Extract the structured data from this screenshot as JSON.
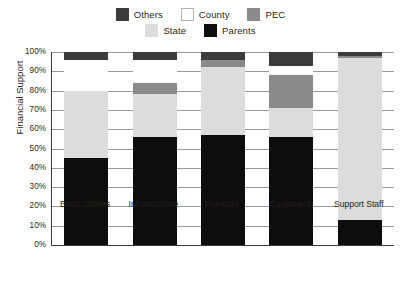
{
  "chart_data": {
    "type": "bar",
    "subtype": "stacked-bar-100-percent",
    "title": "",
    "xlabel": "",
    "ylabel": "Financial Support",
    "ylim": [
      0,
      100
    ],
    "yticks": [
      "0%",
      "10%",
      "20%",
      "30%",
      "40%",
      "50%",
      "60%",
      "70%",
      "80%",
      "90%",
      "100%"
    ],
    "grid": true,
    "legend_position": "top-center",
    "categories": [
      "Basic Utilities",
      "Infrastructure",
      "Furniture",
      "Equipment",
      "Support Staff"
    ],
    "series": [
      {
        "name": "Parents",
        "color": "#0d0d0d",
        "values": [
          45,
          56,
          57,
          56,
          13
        ]
      },
      {
        "name": "State",
        "color": "#dcdcdc",
        "values": [
          35,
          22,
          35,
          15,
          84
        ]
      },
      {
        "name": "PEC",
        "color": "#8a8a8a",
        "values": [
          0,
          6,
          4,
          17,
          1
        ]
      },
      {
        "name": "County",
        "color": "#ffffff",
        "values": [
          16,
          12,
          0,
          5,
          0
        ]
      },
      {
        "name": "Others",
        "color": "#3b3b3b",
        "values": [
          4,
          4,
          4,
          7,
          2
        ]
      }
    ]
  },
  "legend": {
    "rows": [
      [
        {
          "label": "Others",
          "color": "#3b3b3b",
          "border": "none"
        },
        {
          "label": "County",
          "color": "#ffffff",
          "border": "1px solid #b4b4b4"
        },
        {
          "label": "PEC",
          "color": "#8a8a8a",
          "border": "none"
        }
      ],
      [
        {
          "label": "State",
          "color": "#dcdcdc",
          "border": "none"
        },
        {
          "label": "Parents",
          "color": "#0d0d0d",
          "border": "none"
        }
      ]
    ]
  }
}
